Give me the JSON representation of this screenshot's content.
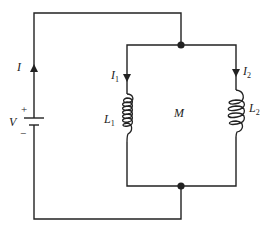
{
  "diagram": {
    "type": "circuit",
    "labels": {
      "source_current": "I",
      "voltage": "V",
      "plus": "+",
      "minus": "−",
      "branch1_current_main": "I",
      "branch1_current_sub": "1",
      "branch2_current_main": "I",
      "branch2_current_sub": "2",
      "inductor1_main": "L",
      "inductor1_sub": "1",
      "inductor2_main": "L",
      "inductor2_sub": "2",
      "mutual": "M"
    },
    "components": [
      {
        "id": "source",
        "kind": "battery",
        "label": "V"
      },
      {
        "id": "L1",
        "kind": "inductor",
        "label": "L1"
      },
      {
        "id": "L2",
        "kind": "inductor",
        "label": "L2"
      },
      {
        "id": "mutual",
        "kind": "mutual-inductance",
        "label": "M"
      }
    ],
    "colors": {
      "line": "#222222",
      "background": "#ffffff"
    }
  }
}
